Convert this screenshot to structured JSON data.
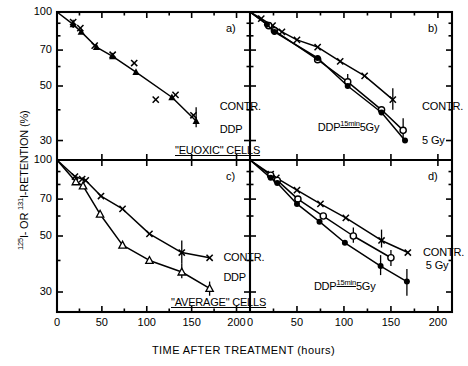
{
  "figure": {
    "y_axis_title_parts": {
      "pre_sup": "125",
      "pre": "I- OR ",
      "mid_sup": "131",
      "post": "I-RETENTION (%)"
    },
    "y_axis_title_plain": "125I- OR 131I-RETENTION (%)",
    "x_axis_title": "TIME AFTER TREATMENT (hours)",
    "y_ticks": [
      "100",
      "70",
      "50",
      "30"
    ],
    "x_ticks": [
      "0",
      "50",
      "100",
      "150",
      "200"
    ],
    "y_range": [
      25,
      100
    ],
    "x_range": [
      0,
      215
    ],
    "line_color": "#000000",
    "axis_color": "#000000"
  },
  "panels": [
    {
      "id": "a)",
      "group_label": "\"EUOXIC\" CELLS",
      "group_label_visible": true,
      "annotations": [
        {
          "text": "CONTR.",
          "x": 178,
          "y": 41
        },
        {
          "text": "DDP",
          "x": 178,
          "y": 33
        }
      ],
      "series": [
        {
          "name": "CONTR.",
          "marker": "x",
          "x": [
            18,
            26,
            42,
            62,
            86,
            110,
            132,
            152
          ],
          "y": [
            91,
            86,
            73,
            67,
            62,
            44,
            46,
            38
          ],
          "line": false
        },
        {
          "name": "DDP",
          "marker": "filled-triangle",
          "x": [
            18,
            27,
            44,
            62,
            88,
            128,
            155
          ],
          "y": [
            89,
            83,
            72,
            66,
            57,
            45,
            36
          ],
          "line": true,
          "err": [
            {
              "x": 18,
              "lo": 86,
              "hi": 93
            },
            {
              "x": 155,
              "lo": 34,
              "hi": 41
            }
          ]
        }
      ]
    },
    {
      "id": "b)",
      "group_label": "",
      "group_label_visible": false,
      "annotations": [
        {
          "text": "CONTR.",
          "x": 180,
          "y": 41
        },
        {
          "text": "5 Gy",
          "x": 180,
          "y": 30
        }
      ],
      "ddp_label": {
        "pre": "DDP",
        "sup": "15min",
        "post": "5Gy",
        "x": 72,
        "y": 34.5
      },
      "series": [
        {
          "name": "CONTR.",
          "marker": "x",
          "x": [
            12,
            24,
            34,
            50,
            72,
            96,
            122,
            152
          ],
          "y": [
            94,
            88,
            83,
            77,
            72,
            63,
            55,
            44
          ],
          "line": true,
          "err": [
            {
              "x": 152,
              "lo": 40,
              "hi": 49
            }
          ]
        },
        {
          "name": "5 Gy",
          "marker": "open-circle",
          "x": [
            20,
            26,
            72,
            104,
            140,
            163
          ],
          "y": [
            88,
            84,
            64,
            52,
            40,
            33
          ],
          "line": true,
          "err": [
            {
              "x": 104,
              "lo": 49,
              "hi": 56
            },
            {
              "x": 163,
              "lo": 30,
              "hi": 37
            }
          ]
        },
        {
          "name": "DDP 15min 5Gy",
          "marker": "filled-circle",
          "x": [
            18,
            26,
            72,
            104,
            140,
            165
          ],
          "y": [
            89,
            83,
            65,
            50,
            39,
            30
          ],
          "line": true
        }
      ]
    },
    {
      "id": "c)",
      "group_label": "\"AVERAGE\" CELLS",
      "group_label_visible": true,
      "annotations": [
        {
          "text": "CONTR.",
          "x": 182,
          "y": 41
        },
        {
          "text": "DDP",
          "x": 182,
          "y": 34
        }
      ],
      "series": [
        {
          "name": "CONTR.",
          "marker": "x",
          "x": [
            20,
            28,
            32,
            49,
            73,
            103,
            139,
            170
          ],
          "y": [
            86,
            84,
            83,
            72,
            64,
            51,
            43,
            41
          ],
          "line": true,
          "err": [
            {
              "x": 139,
              "lo": 39,
              "hi": 48
            }
          ]
        },
        {
          "name": "DDP",
          "marker": "open-triangle",
          "x": [
            21,
            29,
            48,
            73,
            103,
            139,
            170
          ],
          "y": [
            82,
            79,
            61,
            46,
            40,
            36,
            31
          ],
          "line": true,
          "err": [
            {
              "x": 139,
              "lo": 34,
              "hi": 39
            },
            {
              "x": 170,
              "lo": 29,
              "hi": 33
            }
          ]
        }
      ]
    },
    {
      "id": "d)",
      "group_label": "",
      "group_label_visible": false,
      "annotations": [
        {
          "text": "CONTR.",
          "x": 181,
          "y": 43
        },
        {
          "text": "5 Gy",
          "x": 184,
          "y": 38
        }
      ],
      "ddp_label": {
        "pre": "DDP",
        "sup": "15min",
        "post": "5Gy",
        "x": 68,
        "y": 32
      },
      "series": [
        {
          "name": "CONTR.",
          "marker": "x",
          "x": [
            22,
            28,
            50,
            75,
            102,
            140,
            168
          ],
          "y": [
            88,
            85,
            76,
            67,
            59,
            48,
            43
          ],
          "line": true,
          "err": [
            {
              "x": 140,
              "lo": 45,
              "hi": 53
            }
          ]
        },
        {
          "name": "5 Gy",
          "marker": "open-circle",
          "x": [
            22,
            29,
            51,
            78,
            110,
            150
          ],
          "y": [
            87,
            83,
            70,
            60,
            50,
            41
          ],
          "line": true,
          "err": [
            {
              "x": 110,
              "lo": 47,
              "hi": 54
            },
            {
              "x": 150,
              "lo": 38,
              "hi": 44
            }
          ]
        },
        {
          "name": "DDP 15min 5Gy",
          "marker": "filled-circle",
          "x": [
            22,
            29,
            50,
            74,
            101,
            139,
            167
          ],
          "y": [
            85,
            81,
            67,
            57,
            47,
            38,
            33
          ],
          "line": true,
          "err": [
            {
              "x": 139,
              "lo": 35,
              "hi": 42
            },
            {
              "x": 167,
              "lo": 29,
              "hi": 37
            }
          ]
        }
      ]
    }
  ]
}
